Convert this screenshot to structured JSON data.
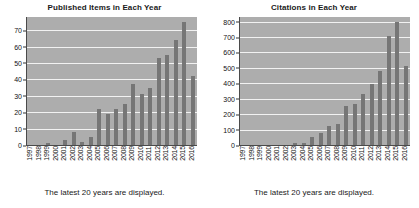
{
  "charts": [
    {
      "title": "Published Items in Each Year",
      "caption": "The latest 20 years are displayed."
    },
    {
      "title": "Citations in Each Year",
      "caption": "The latest 20 years are displayed."
    }
  ],
  "style": {
    "plot_background": "#adadad",
    "bar_color": "#767676",
    "gridline_color": "#f2f2f2",
    "axis_color": "#4a4a4a",
    "text_color": "#1a1a1a"
  },
  "chart_data": [
    {
      "type": "bar",
      "title": "Published Items in Each Year",
      "caption": "The latest 20 years are displayed.",
      "xlabel": "",
      "ylabel": "",
      "grid": true,
      "legend": "none",
      "ylim": [
        0,
        78
      ],
      "yticks": [
        0,
        10,
        20,
        30,
        40,
        50,
        60,
        70
      ],
      "categories": [
        "1997",
        "1998",
        "1999",
        "2000",
        "2001",
        "2002",
        "2003",
        "2004",
        "2005",
        "2006",
        "2007",
        "2008",
        "2009",
        "2010",
        "2011",
        "2012",
        "2013",
        "2014",
        "2015",
        "2016"
      ],
      "values": [
        0,
        0,
        1,
        0,
        3,
        8,
        2,
        5,
        22,
        19,
        22,
        25,
        37,
        31,
        35,
        53,
        55,
        64,
        75,
        42
      ]
    },
    {
      "type": "bar",
      "title": "Citations in Each Year",
      "caption": "The latest 20 years are displayed.",
      "xlabel": "",
      "ylabel": "",
      "grid": true,
      "legend": "none",
      "ylim": [
        0,
        830
      ],
      "yticks": [
        0,
        100,
        200,
        300,
        400,
        500,
        600,
        700,
        800
      ],
      "categories": [
        "1997",
        "1998",
        "1999",
        "2000",
        "2001",
        "2002",
        "2003",
        "2004",
        "2005",
        "2006",
        "2007",
        "2008",
        "2009",
        "2010",
        "2011",
        "2012",
        "2013",
        "2014",
        "2015",
        "2016"
      ],
      "values": [
        0,
        0,
        0,
        0,
        0,
        0,
        10,
        15,
        50,
        75,
        123,
        135,
        252,
        267,
        330,
        393,
        478,
        710,
        797,
        512
      ]
    }
  ]
}
